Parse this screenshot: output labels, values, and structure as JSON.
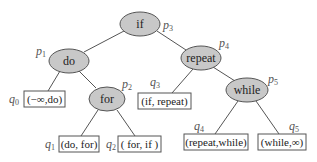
{
  "diagram": {
    "type": "binary-search-tree",
    "internal_nodes": [
      {
        "id": "p3",
        "key": "if",
        "label": "p",
        "sub": "3"
      },
      {
        "id": "p1",
        "key": "do",
        "label": "p",
        "sub": "1"
      },
      {
        "id": "p4",
        "key": "repeat",
        "label": "p",
        "sub": "4"
      },
      {
        "id": "p2",
        "key": "for",
        "label": "p",
        "sub": "2"
      },
      {
        "id": "p5",
        "key": "while",
        "label": "p",
        "sub": "5"
      }
    ],
    "leaves": [
      {
        "id": "q0",
        "interval": "(−∞,do)",
        "label": "q",
        "sub": "0"
      },
      {
        "id": "q1",
        "interval": "(do, for)",
        "label": "q",
        "sub": "1"
      },
      {
        "id": "q2",
        "interval": "( for, if )",
        "label": "q",
        "sub": "2"
      },
      {
        "id": "q3",
        "interval": "(if, repeat)",
        "label": "q",
        "sub": "3"
      },
      {
        "id": "q4",
        "interval": "(repeat,while)",
        "label": "q",
        "sub": "4"
      },
      {
        "id": "q5",
        "interval": "(while,∞)",
        "label": "q",
        "sub": "5"
      }
    ],
    "edges": [
      [
        "p3",
        "p1"
      ],
      [
        "p3",
        "p4"
      ],
      [
        "p1",
        "q0"
      ],
      [
        "p1",
        "p2"
      ],
      [
        "p2",
        "q1"
      ],
      [
        "p2",
        "q2"
      ],
      [
        "p4",
        "q3"
      ],
      [
        "p4",
        "p5"
      ],
      [
        "p5",
        "q4"
      ],
      [
        "p5",
        "q5"
      ]
    ],
    "colors": {
      "node_fill": "#c8c8c8",
      "stroke": "#555555",
      "box_fill": "#ffffff"
    }
  }
}
